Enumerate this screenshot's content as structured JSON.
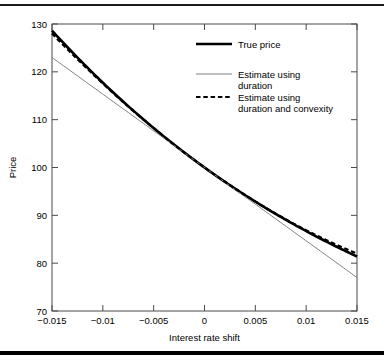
{
  "chart_data": {
    "type": "line",
    "title": "",
    "xlabel": "Interest rate shift",
    "ylabel": "Price",
    "xlim": [
      -0.015,
      0.015
    ],
    "ylim": [
      70,
      130
    ],
    "xticks": [
      -0.015,
      -0.01,
      -0.005,
      0,
      0.005,
      0.01,
      0.015
    ],
    "xtick_labels": [
      "-0.015",
      "-0.01",
      "-0.005",
      "0",
      "0.005",
      "0.01",
      "0.015"
    ],
    "yticks": [
      70,
      80,
      90,
      100,
      110,
      120,
      130
    ],
    "ytick_labels": [
      "70",
      "80",
      "90",
      "100",
      "110",
      "120",
      "130"
    ],
    "grid": false,
    "legend_position": "upper right",
    "x": [
      -0.015,
      -0.0135,
      -0.012,
      -0.0105,
      -0.009,
      -0.0075,
      -0.006,
      -0.0045,
      -0.003,
      -0.0015,
      0,
      0.0015,
      0.003,
      0.0045,
      0.006,
      0.0075,
      0.009,
      0.0105,
      0.012,
      0.0135,
      0.015
    ],
    "series": [
      {
        "name": "True price",
        "style": "solid-thick",
        "color": "#000000",
        "values": [
          127.5,
          124.77,
          122.11,
          119.53,
          117.02,
          114.58,
          112.21,
          109.9,
          107.66,
          105.48,
          100.0,
          101.31,
          99.31,
          97.36,
          95.47,
          93.63,
          91.84,
          90.1,
          88.4,
          86.75,
          80.0
        ]
      },
      {
        "name": "Estimate using duration",
        "style": "solid-thin",
        "color": "#808080",
        "values": [
          122.5,
          121.0,
          119.5,
          118.0,
          116.5,
          115.0,
          113.5,
          112.0,
          110.5,
          109.0,
          100.0,
          98.5,
          97.0,
          95.5,
          94.0,
          92.5,
          91.0,
          89.5,
          88.0,
          86.5,
          76.5
        ]
      },
      {
        "name": "Estimate using duration and convexity",
        "style": "dashed",
        "color": "#000000",
        "values": [
          126.8,
          124.2,
          121.68,
          119.22,
          116.82,
          114.48,
          112.2,
          109.98,
          107.82,
          105.72,
          100.0,
          101.7,
          99.72,
          97.8,
          95.94,
          94.14,
          92.4,
          90.72,
          89.1,
          87.54,
          80.5
        ]
      }
    ],
    "legend": [
      {
        "label_line1": "True price",
        "label_line2": "",
        "style": "solid-thick"
      },
      {
        "label_line1": "Estimate using",
        "label_line2": "duration",
        "style": "solid-thin"
      },
      {
        "label_line1": "Estimate using",
        "label_line2": "duration and convexity",
        "style": "dashed"
      }
    ]
  }
}
